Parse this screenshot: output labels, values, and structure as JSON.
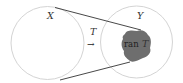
{
  "diagram": {
    "domain_label": "X",
    "codomain_label": "Y",
    "map_label": "T",
    "arrow_glyph": "→",
    "range_prefix": "ran",
    "range_symbol": "T"
  },
  "colors": {
    "circle_stroke": "#d4d4d4",
    "line": "#333333",
    "range_fill": "#6e6e6e",
    "text": "#333333"
  }
}
